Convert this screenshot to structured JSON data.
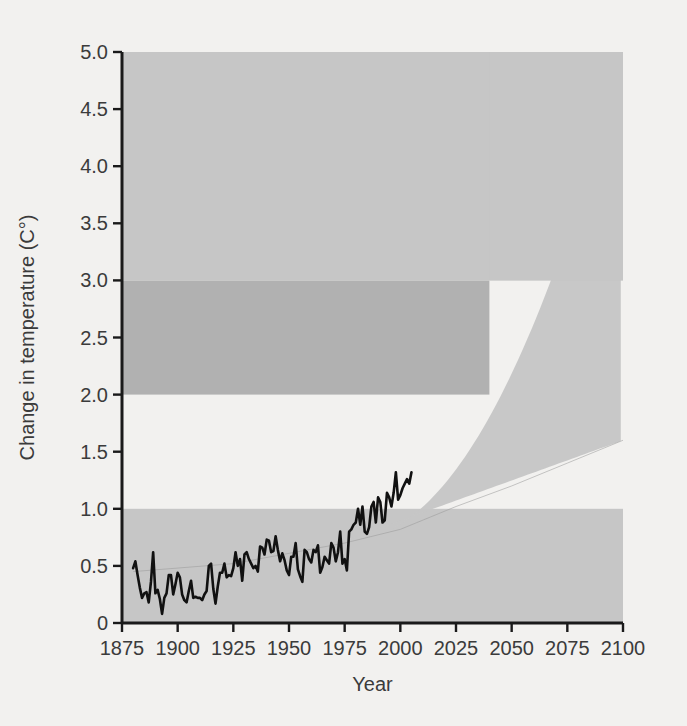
{
  "chart_data": {
    "type": "line",
    "title": "",
    "xlabel": "Year",
    "ylabel": "Change in temperature (C°)",
    "xlim": [
      1875,
      2100
    ],
    "ylim": [
      0,
      5.0
    ],
    "grid": false,
    "legend": null,
    "xticks": [
      1875,
      1900,
      1925,
      1950,
      1975,
      2000,
      2025,
      2050,
      2075,
      2100
    ],
    "xtick_labels": [
      "1875",
      "1900",
      "1925",
      "1950",
      "1975",
      "2000",
      "2025",
      "2050",
      "2075",
      "2100"
    ],
    "yticks": [
      0,
      0.5,
      1.0,
      1.5,
      2.0,
      2.5,
      3.0,
      3.5,
      4.0,
      4.5,
      5.0
    ],
    "ytick_labels": [
      "0",
      "0.5",
      "1.0",
      "1.5",
      "2.0",
      "2.5",
      "3.0",
      "3.5",
      "4.0",
      "4.5",
      "5.0"
    ],
    "colors": {
      "band_light": "#c6c6c6",
      "band_dark": "#b1b1b1",
      "observed_line": "#111111",
      "projection_line": "#9a9a9a",
      "background": "#f2f1ef",
      "axis": "#1a1a1a",
      "text": "#3b3b3b"
    },
    "bands": [
      {
        "name": "low-impact-band",
        "y_from": 0.0,
        "y_to": 1.0,
        "x_from": 1875,
        "x_to": 2100,
        "shade": "light"
      },
      {
        "name": "mid-impact-band",
        "y_from": 2.0,
        "y_to": 3.0,
        "x_from": 1875,
        "x_to": 2040,
        "shade": "dark"
      },
      {
        "name": "high-impact-band",
        "y_from": 3.0,
        "y_to": 5.0,
        "x_from": 1875,
        "x_to": 2100,
        "shade": "light"
      }
    ],
    "projection_cone": {
      "name": "projection-uncertainty-cone",
      "start_year": 1975,
      "end_year": 2100,
      "upper_at_2100": 5.0,
      "lower_at_2100": 1.6,
      "shade": "light"
    },
    "series": [
      {
        "name": "Observed global temperature anomaly",
        "type": "line",
        "x": [
          1880,
          1881,
          1882,
          1883,
          1884,
          1885,
          1886,
          1887,
          1888,
          1889,
          1890,
          1891,
          1892,
          1893,
          1894,
          1895,
          1896,
          1897,
          1898,
          1899,
          1900,
          1901,
          1902,
          1903,
          1904,
          1905,
          1906,
          1907,
          1908,
          1909,
          1910,
          1911,
          1912,
          1913,
          1914,
          1915,
          1916,
          1917,
          1918,
          1919,
          1920,
          1921,
          1922,
          1923,
          1924,
          1925,
          1926,
          1927,
          1928,
          1929,
          1930,
          1931,
          1932,
          1933,
          1934,
          1935,
          1936,
          1937,
          1938,
          1939,
          1940,
          1941,
          1942,
          1943,
          1944,
          1945,
          1946,
          1947,
          1948,
          1949,
          1950,
          1951,
          1952,
          1953,
          1954,
          1955,
          1956,
          1957,
          1958,
          1959,
          1960,
          1961,
          1962,
          1963,
          1964,
          1965,
          1966,
          1967,
          1968,
          1969,
          1970,
          1971,
          1972,
          1973,
          1974,
          1975,
          1976,
          1977,
          1978,
          1979,
          1980,
          1981,
          1982,
          1983,
          1984,
          1985,
          1986,
          1987,
          1988,
          1989,
          1990,
          1991,
          1992,
          1993,
          1994,
          1995,
          1996,
          1997,
          1998,
          1999,
          2000,
          2001,
          2002,
          2003,
          2004,
          2005
        ],
        "y": [
          0.48,
          0.54,
          0.42,
          0.31,
          0.22,
          0.26,
          0.27,
          0.18,
          0.36,
          0.62,
          0.26,
          0.29,
          0.21,
          0.08,
          0.22,
          0.26,
          0.42,
          0.42,
          0.25,
          0.34,
          0.44,
          0.4,
          0.25,
          0.2,
          0.18,
          0.28,
          0.37,
          0.22,
          0.23,
          0.22,
          0.22,
          0.2,
          0.25,
          0.28,
          0.5,
          0.52,
          0.3,
          0.17,
          0.32,
          0.44,
          0.44,
          0.52,
          0.4,
          0.42,
          0.41,
          0.48,
          0.62,
          0.5,
          0.56,
          0.37,
          0.6,
          0.62,
          0.56,
          0.52,
          0.48,
          0.5,
          0.45,
          0.67,
          0.66,
          0.6,
          0.73,
          0.72,
          0.62,
          0.63,
          0.76,
          0.64,
          0.54,
          0.61,
          0.55,
          0.46,
          0.42,
          0.58,
          0.58,
          0.7,
          0.47,
          0.41,
          0.36,
          0.64,
          0.62,
          0.56,
          0.53,
          0.64,
          0.62,
          0.68,
          0.44,
          0.49,
          0.58,
          0.55,
          0.52,
          0.7,
          0.66,
          0.54,
          0.62,
          0.8,
          0.52,
          0.56,
          0.46,
          0.8,
          0.82,
          0.86,
          0.88,
          1.0,
          0.86,
          1.02,
          0.8,
          0.78,
          0.84,
          1.02,
          1.06,
          0.88,
          1.1,
          1.06,
          0.88,
          0.9,
          1.14,
          1.1,
          1.02,
          1.14,
          1.32,
          1.08,
          1.12,
          1.18,
          1.22,
          1.26,
          1.22,
          1.32
        ]
      },
      {
        "name": "Projection central estimate (lower bound)",
        "type": "line",
        "x": [
          1880,
          1925,
          1975,
          2000,
          2025,
          2050,
          2075,
          2100
        ],
        "y": [
          0.45,
          0.52,
          0.7,
          0.82,
          1.02,
          1.2,
          1.4,
          1.6
        ]
      }
    ]
  },
  "labels": {
    "x_axis_title": "Year",
    "y_axis_title": "Change in temperature (C°)"
  }
}
